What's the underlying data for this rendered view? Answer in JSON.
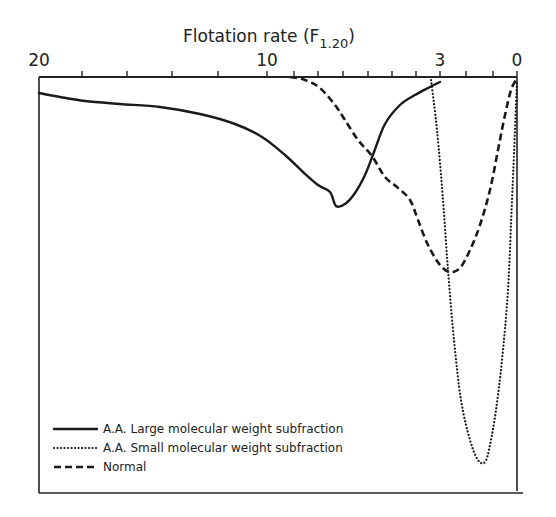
{
  "chart_data": {
    "type": "line",
    "title": "Flotation rate (F1.20)",
    "title_main": "Flotation rate (F",
    "title_sub": "1.20",
    "title_close": ")",
    "xlabel": "Flotation rate (F1.20)",
    "ylabel": "",
    "x_axis_position": "top",
    "x_reversed": true,
    "tick_labels": [
      "20",
      "10",
      "3",
      "0"
    ],
    "tick_label_positions_px": [
      39,
      267,
      440,
      517
    ],
    "minor_ticks_px": [
      82,
      127,
      172,
      218,
      267,
      294,
      318,
      343,
      368,
      392,
      416,
      440,
      466,
      493,
      517
    ],
    "grid": false,
    "legend_position": "lower-left",
    "series": [
      {
        "name": "A.A. Large molecular weight subfraction",
        "style": "solid",
        "points_px": [
          [
            39,
            93
          ],
          [
            60,
            97
          ],
          [
            85,
            101
          ],
          [
            120,
            104
          ],
          [
            160,
            107
          ],
          [
            200,
            114
          ],
          [
            235,
            124
          ],
          [
            262,
            137
          ],
          [
            285,
            155
          ],
          [
            303,
            172
          ],
          [
            318,
            185
          ],
          [
            330,
            192
          ],
          [
            336,
            206
          ],
          [
            345,
            204
          ],
          [
            355,
            193
          ],
          [
            365,
            175
          ],
          [
            374,
            152
          ],
          [
            385,
            124
          ],
          [
            400,
            105
          ],
          [
            415,
            95
          ],
          [
            430,
            87
          ],
          [
            440,
            82
          ]
        ]
      },
      {
        "name": "A.A. Small molecular weight subfraction",
        "style": "dotted",
        "points_px": [
          [
            431,
            80
          ],
          [
            437,
            130
          ],
          [
            443,
            200
          ],
          [
            448,
            270
          ],
          [
            454,
            340
          ],
          [
            461,
            400
          ],
          [
            470,
            440
          ],
          [
            478,
            460
          ],
          [
            485,
            462
          ],
          [
            490,
            445
          ],
          [
            496,
            410
          ],
          [
            502,
            360
          ],
          [
            508,
            290
          ],
          [
            512,
            200
          ],
          [
            515,
            130
          ],
          [
            517,
            82
          ]
        ]
      },
      {
        "name": "Normal",
        "style": "dashed",
        "points_px": [
          [
            290,
            77
          ],
          [
            305,
            80
          ],
          [
            320,
            88
          ],
          [
            335,
            105
          ],
          [
            345,
            120
          ],
          [
            358,
            140
          ],
          [
            372,
            156
          ],
          [
            385,
            177
          ],
          [
            397,
            187
          ],
          [
            410,
            200
          ],
          [
            418,
            220
          ],
          [
            428,
            245
          ],
          [
            440,
            265
          ],
          [
            450,
            272
          ],
          [
            460,
            268
          ],
          [
            470,
            250
          ],
          [
            480,
            225
          ],
          [
            490,
            190
          ],
          [
            498,
            150
          ],
          [
            505,
            115
          ],
          [
            511,
            90
          ],
          [
            516,
            80
          ]
        ]
      }
    ],
    "plot_box": {
      "left": 39,
      "right": 517,
      "top": 77,
      "bottom": 493,
      "outer_right": 523
    }
  },
  "legend": {
    "items": [
      {
        "label": "A.A. Large molecular weight subfraction",
        "style": "solid"
      },
      {
        "label": "A.A. Small molecular weight subfraction",
        "style": "dotted"
      },
      {
        "label": "Normal",
        "style": "dashed"
      }
    ]
  }
}
